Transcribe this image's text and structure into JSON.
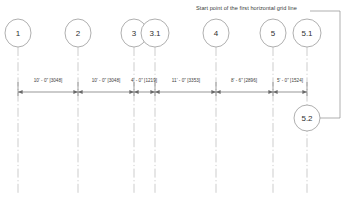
{
  "drawing": {
    "title_note": "Start point of the first horizontal grid line",
    "units_note_primary": "feet-inches",
    "units_note_secondary": "millimeters",
    "colors": {
      "grid_line": "#b8b8b8",
      "bubble_stroke": "#9a9a9a",
      "dimension_line": "#6a6a6a",
      "leader_line": "#8c8c8c",
      "text": "#3a3a3a",
      "background": "#ffffff"
    },
    "grid_bubbles": [
      {
        "id": "grid-bubble-1",
        "label": "1",
        "x": 18,
        "cy": 33,
        "rx": 13,
        "ry": 14
      },
      {
        "id": "grid-bubble-2",
        "label": "2",
        "x": 78,
        "cy": 33,
        "rx": 13,
        "ry": 14
      },
      {
        "id": "grid-bubble-3",
        "label": "3",
        "x": 134,
        "cy": 33,
        "rx": 13,
        "ry": 14
      },
      {
        "id": "grid-bubble-3-1",
        "label": "3.1",
        "x": 155,
        "cy": 33,
        "rx": 14,
        "ry": 14
      },
      {
        "id": "grid-bubble-4",
        "label": "4",
        "x": 216,
        "cy": 33,
        "rx": 13,
        "ry": 14
      },
      {
        "id": "grid-bubble-5",
        "label": "5",
        "x": 273,
        "cy": 33,
        "rx": 13,
        "ry": 14
      },
      {
        "id": "grid-bubble-5-1",
        "label": "5.1",
        "x": 307,
        "cy": 33,
        "rx": 14,
        "ry": 14
      }
    ],
    "callout_bubble": {
      "id": "grid-bubble-5-2",
      "label": "5.2",
      "cx": 307,
      "cy": 118,
      "rx": 13,
      "ry": 13
    },
    "dimensions": [
      {
        "id": "dim-1-2",
        "label": "10' - 0\" [3048]",
        "from": 18,
        "to": 78,
        "center": 48
      },
      {
        "id": "dim-2-3",
        "label": "10' - 0\" [3048]",
        "from": 78,
        "to": 134,
        "center": 106
      },
      {
        "id": "dim-3-3.1",
        "label": "4' - 0\" [1219]",
        "from": 134,
        "to": 155,
        "center": 144
      },
      {
        "id": "dim-3.1-4",
        "label": "11' - 0\" [3353]",
        "from": 155,
        "to": 216,
        "center": 186
      },
      {
        "id": "dim-4-5",
        "label": "8' - 6\" [2896]",
        "from": 216,
        "to": 273,
        "center": 244
      },
      {
        "id": "dim-5-5.1",
        "label": "5' - 0\" [1524]",
        "from": 273,
        "to": 307,
        "center": 290
      }
    ],
    "dimension_line_y": 92,
    "grid_line_top": 47,
    "grid_line_bottom": 193,
    "note_position": {
      "x": 196,
      "y": 8
    }
  }
}
